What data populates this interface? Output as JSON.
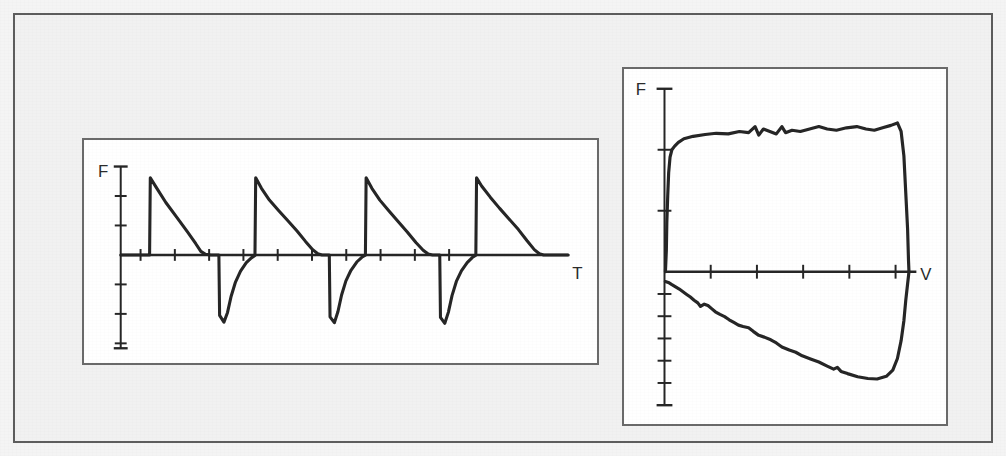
{
  "figure": {
    "background_color": "#f1f1f1",
    "frame_color": "#5d5d5d",
    "trace_color": "#262626"
  },
  "panels": [
    {
      "id": "flow-time",
      "y_axis_label": "F",
      "x_axis_label": "T"
    },
    {
      "id": "flow-volume",
      "y_axis_label": "F",
      "x_axis_label": "V"
    }
  ],
  "chart_data": [
    {
      "type": "line",
      "id": "flow-time",
      "title": "",
      "subtitle": "",
      "xlabel": "T",
      "ylabel": "F",
      "xlim": [
        0,
        10
      ],
      "ylim": [
        -3,
        3
      ],
      "grid": false,
      "legend": "none",
      "annotations": [],
      "x_ticks": [
        0.55,
        1.5,
        2.45,
        3.4,
        4.35,
        5.3,
        6.25,
        7.2,
        8.15,
        9.1
      ],
      "y_ticks": [
        -3,
        -2,
        -1,
        0,
        1,
        2,
        3
      ],
      "series": [
        {
          "name": "flow",
          "points": [
            [
              0.0,
              0.0
            ],
            [
              0.45,
              0.0
            ],
            [
              0.8,
              0.0
            ],
            [
              0.82,
              2.62
            ],
            [
              0.98,
              2.3
            ],
            [
              1.25,
              1.78
            ],
            [
              1.55,
              1.28
            ],
            [
              1.85,
              0.78
            ],
            [
              2.08,
              0.38
            ],
            [
              2.22,
              0.12
            ],
            [
              2.35,
              0.02
            ],
            [
              2.5,
              0.0
            ],
            [
              2.72,
              0.0
            ],
            [
              2.74,
              -2.05
            ],
            [
              2.86,
              -2.28
            ],
            [
              2.96,
              -1.95
            ],
            [
              3.06,
              -1.4
            ],
            [
              3.18,
              -0.92
            ],
            [
              3.32,
              -0.55
            ],
            [
              3.48,
              -0.26
            ],
            [
              3.62,
              -0.1
            ],
            [
              3.72,
              -0.02
            ],
            [
              3.74,
              2.62
            ],
            [
              3.9,
              2.26
            ],
            [
              4.12,
              1.86
            ],
            [
              4.38,
              1.5
            ],
            [
              4.62,
              1.18
            ],
            [
              4.88,
              0.82
            ],
            [
              5.12,
              0.46
            ],
            [
              5.32,
              0.18
            ],
            [
              5.46,
              0.04
            ],
            [
              5.58,
              0.0
            ],
            [
              5.78,
              0.0
            ],
            [
              5.8,
              -2.1
            ],
            [
              5.92,
              -2.3
            ],
            [
              6.02,
              -1.92
            ],
            [
              6.12,
              -1.36
            ],
            [
              6.24,
              -0.88
            ],
            [
              6.38,
              -0.52
            ],
            [
              6.54,
              -0.24
            ],
            [
              6.68,
              -0.08
            ],
            [
              6.78,
              -0.01
            ],
            [
              6.8,
              2.62
            ],
            [
              6.96,
              2.26
            ],
            [
              7.18,
              1.86
            ],
            [
              7.44,
              1.48
            ],
            [
              7.68,
              1.14
            ],
            [
              7.94,
              0.78
            ],
            [
              8.18,
              0.42
            ],
            [
              8.38,
              0.16
            ],
            [
              8.52,
              0.03
            ],
            [
              8.64,
              0.0
            ],
            [
              8.84,
              0.0
            ],
            [
              8.86,
              -2.12
            ],
            [
              8.98,
              -2.32
            ],
            [
              9.08,
              -1.94
            ],
            [
              9.18,
              -1.38
            ],
            [
              9.3,
              -0.9
            ],
            [
              9.44,
              -0.54
            ],
            [
              9.6,
              -0.26
            ],
            [
              9.74,
              -0.09
            ],
            [
              9.84,
              -0.01
            ],
            [
              9.86,
              2.62
            ],
            [
              10.0,
              2.34
            ],
            [
              10.24,
              1.96
            ],
            [
              10.5,
              1.58
            ],
            [
              10.76,
              1.22
            ],
            [
              11.02,
              0.86
            ],
            [
              11.26,
              0.48
            ],
            [
              11.46,
              0.18
            ],
            [
              11.6,
              0.04
            ],
            [
              11.72,
              0.0
            ],
            [
              12.4,
              0.0
            ]
          ]
        }
      ]
    },
    {
      "type": "line",
      "id": "flow-volume",
      "title": "",
      "subtitle": "",
      "xlabel": "V",
      "ylabel": "F",
      "xlim": [
        0,
        6
      ],
      "ylim": [
        -6,
        3
      ],
      "grid": false,
      "legend": "none",
      "annotations": [],
      "x_ticks": [
        0,
        1,
        2,
        3,
        4,
        5,
        6
      ],
      "y_ticks": [
        -6,
        -5,
        -4,
        -3,
        -2,
        -1,
        0,
        1,
        2,
        3
      ],
      "series": [
        {
          "name": "expiratory-limb",
          "points": [
            [
              0.02,
              0.0
            ],
            [
              0.04,
              0.35
            ],
            [
              0.05,
              0.8
            ],
            [
              0.07,
              1.25
            ],
            [
              0.09,
              1.62
            ],
            [
              0.12,
              1.88
            ],
            [
              0.16,
              2.0
            ],
            [
              0.22,
              2.06
            ],
            [
              0.3,
              2.12
            ],
            [
              0.42,
              2.18
            ],
            [
              0.62,
              2.22
            ],
            [
              0.88,
              2.25
            ],
            [
              1.12,
              2.27
            ],
            [
              1.38,
              2.26
            ],
            [
              1.62,
              2.3
            ],
            [
              1.82,
              2.28
            ],
            [
              1.96,
              2.38
            ],
            [
              2.04,
              2.24
            ],
            [
              2.14,
              2.34
            ],
            [
              2.28,
              2.3
            ],
            [
              2.42,
              2.26
            ],
            [
              2.54,
              2.38
            ],
            [
              2.62,
              2.28
            ],
            [
              2.76,
              2.32
            ],
            [
              2.94,
              2.3
            ],
            [
              3.14,
              2.34
            ],
            [
              3.34,
              2.38
            ],
            [
              3.52,
              2.34
            ],
            [
              3.72,
              2.32
            ],
            [
              3.94,
              2.36
            ],
            [
              4.16,
              2.38
            ],
            [
              4.36,
              2.34
            ],
            [
              4.54,
              2.32
            ],
            [
              4.72,
              2.36
            ],
            [
              4.9,
              2.4
            ],
            [
              5.04,
              2.44
            ],
            [
              5.12,
              2.3
            ],
            [
              5.18,
              1.9
            ],
            [
              5.22,
              1.3
            ],
            [
              5.26,
              0.7
            ],
            [
              5.28,
              0.18
            ],
            [
              5.29,
              0.0
            ]
          ]
        },
        {
          "name": "inspiratory-limb",
          "points": [
            [
              5.29,
              0.0
            ],
            [
              5.26,
              -0.55
            ],
            [
              5.22,
              -1.3
            ],
            [
              5.18,
              -2.2
            ],
            [
              5.12,
              -3.1
            ],
            [
              5.04,
              -3.9
            ],
            [
              4.94,
              -4.42
            ],
            [
              4.8,
              -4.7
            ],
            [
              4.6,
              -4.82
            ],
            [
              4.4,
              -4.8
            ],
            [
              4.18,
              -4.72
            ],
            [
              3.96,
              -4.58
            ],
            [
              3.82,
              -4.48
            ],
            [
              3.74,
              -4.3
            ],
            [
              3.66,
              -4.38
            ],
            [
              3.52,
              -4.24
            ],
            [
              3.34,
              -4.06
            ],
            [
              3.16,
              -3.92
            ],
            [
              2.98,
              -3.78
            ],
            [
              2.84,
              -3.62
            ],
            [
              2.7,
              -3.52
            ],
            [
              2.54,
              -3.38
            ],
            [
              2.42,
              -3.2
            ],
            [
              2.3,
              -3.06
            ],
            [
              2.16,
              -2.94
            ],
            [
              2.04,
              -2.86
            ],
            [
              1.92,
              -2.68
            ],
            [
              1.82,
              -2.52
            ],
            [
              1.7,
              -2.46
            ],
            [
              1.6,
              -2.4
            ],
            [
              1.5,
              -2.28
            ],
            [
              1.4,
              -2.16
            ],
            [
              1.3,
              -2.02
            ],
            [
              1.2,
              -1.92
            ],
            [
              1.1,
              -1.8
            ],
            [
              1.02,
              -1.66
            ],
            [
              0.94,
              -1.52
            ],
            [
              0.86,
              -1.46
            ],
            [
              0.78,
              -1.56
            ],
            [
              0.72,
              -1.4
            ],
            [
              0.64,
              -1.28
            ],
            [
              0.56,
              -1.14
            ],
            [
              0.48,
              -1.02
            ],
            [
              0.4,
              -0.9
            ],
            [
              0.32,
              -0.78
            ],
            [
              0.24,
              -0.68
            ],
            [
              0.16,
              -0.58
            ],
            [
              0.1,
              -0.5
            ],
            [
              0.05,
              -0.46
            ],
            [
              0.02,
              -0.44
            ]
          ]
        }
      ]
    }
  ]
}
